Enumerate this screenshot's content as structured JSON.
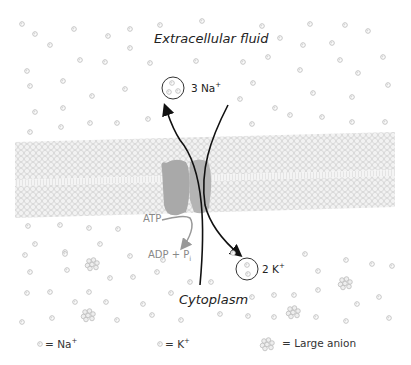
{
  "regions": {
    "top": "Extracellular fluid",
    "bottom": "Cytoplasm"
  },
  "transport": {
    "out_label_prefix": "3 Na",
    "out_label_charge": "+",
    "in_label_prefix": "2 K",
    "in_label_charge": "+"
  },
  "energy": {
    "input": "ATP",
    "output_prefix": "ADP + P",
    "output_sub": "i"
  },
  "legend": [
    {
      "symbol": "small-circle",
      "eq": "= Na",
      "charge": "+"
    },
    {
      "symbol": "small-circle",
      "eq": "= K",
      "charge": "+"
    },
    {
      "symbol": "cluster",
      "eq": "= Large anion",
      "charge": ""
    }
  ],
  "colors": {
    "ion": "#c9c9c9",
    "membrane": "#e6e6e6",
    "pump": "#a8a8a8",
    "arrow": "#111111",
    "atp_arrow": "#9a9a9a"
  }
}
